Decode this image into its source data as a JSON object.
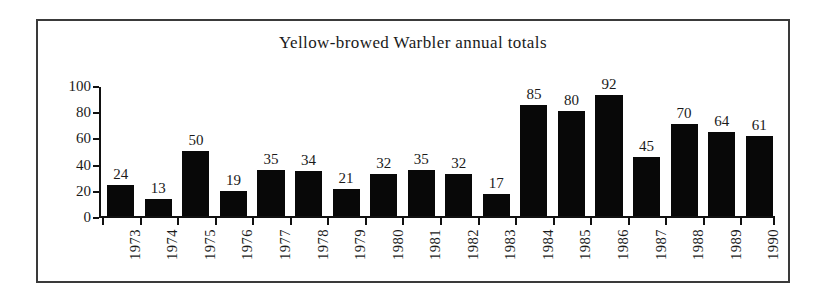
{
  "figure": {
    "frame_color": "#3a3a3a",
    "background": "#ffffff",
    "bar_color": "#080808"
  },
  "chart_data": {
    "type": "bar",
    "title": "Yellow-browed Warbler annual totals",
    "xlabel": "",
    "ylabel": "",
    "categories": [
      "1973",
      "1974",
      "1975",
      "1976",
      "1977",
      "1978",
      "1979",
      "1980",
      "1981",
      "1982",
      "1983",
      "1984",
      "1985",
      "1986",
      "1987",
      "1988",
      "1989",
      "1990"
    ],
    "values": [
      24,
      13,
      50,
      19,
      35,
      34,
      21,
      32,
      35,
      32,
      17,
      85,
      80,
      92,
      45,
      70,
      64,
      61
    ],
    "ylim": [
      0,
      100
    ],
    "yticks": [
      0,
      20,
      40,
      60,
      80,
      100
    ],
    "ytick_labels": [
      "0",
      "20",
      "40",
      "60",
      "80",
      "100"
    ],
    "grid": false,
    "legend": null,
    "data_labels": true,
    "xtick_rotation": 90
  }
}
